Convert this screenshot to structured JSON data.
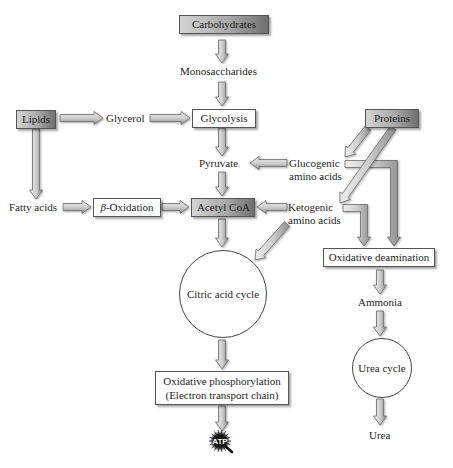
{
  "diagram": {
    "colors": {
      "box_gradient_light": "#d4d4d4",
      "box_gradient_dark": "#6f6f6f",
      "arrow_fill_light": "#e6e6e6",
      "arrow_fill_dark": "#9a9a9a",
      "arrow_stroke": "#6a6a6a",
      "atp_badge": "#111111"
    },
    "nodes": {
      "carbohydrates": "Carbohydrates",
      "monosaccharides": "Monosaccharides",
      "lipids": "Lipids",
      "glycerol": "Glycerol",
      "glycolysis": "Glycolysis",
      "proteins": "Proteins",
      "pyruvate": "Pyruvate",
      "glucogenic_line1": "Glucogenic",
      "glucogenic_line2": "amino acids",
      "fatty_acids": "Fatty acids",
      "beta_prefix": "β",
      "beta_oxidation": "-Oxidation",
      "acetyl_coa": "Acetyl CoA",
      "ketogenic_line1": "Ketogenic",
      "ketogenic_line2": "amino acids",
      "oxidative_deamination": "Oxidative deamination",
      "citric_acid_cycle": "Citric acid cycle",
      "ammonia": "Ammonia",
      "urea_cycle": "Urea cycle",
      "oxphos_line1": "Oxidative phosphorylation",
      "oxphos_line2": "(Electron transport chain)",
      "urea": "Urea",
      "atp": "ATP"
    },
    "edges": [
      {
        "from": "Carbohydrates",
        "to": "Monosaccharides"
      },
      {
        "from": "Monosaccharides",
        "to": "Glycolysis"
      },
      {
        "from": "Lipids",
        "to": "Glycerol"
      },
      {
        "from": "Glycerol",
        "to": "Glycolysis"
      },
      {
        "from": "Lipids",
        "to": "Fatty acids"
      },
      {
        "from": "Glycolysis",
        "to": "Pyruvate"
      },
      {
        "from": "Proteins",
        "to": "Glucogenic amino acids"
      },
      {
        "from": "Proteins",
        "to": "Ketogenic amino acids"
      },
      {
        "from": "Glucogenic amino acids",
        "to": "Pyruvate"
      },
      {
        "from": "Glucogenic amino acids",
        "to": "Oxidative deamination"
      },
      {
        "from": "Fatty acids",
        "to": "β-Oxidation"
      },
      {
        "from": "β-Oxidation",
        "to": "Acetyl CoA"
      },
      {
        "from": "Pyruvate",
        "to": "Acetyl CoA"
      },
      {
        "from": "Ketogenic amino acids",
        "to": "Acetyl CoA"
      },
      {
        "from": "Ketogenic amino acids",
        "to": "Citric acid cycle"
      },
      {
        "from": "Ketogenic amino acids",
        "to": "Oxidative deamination"
      },
      {
        "from": "Acetyl CoA",
        "to": "Citric acid cycle"
      },
      {
        "from": "Citric acid cycle",
        "to": "Oxidative phosphorylation"
      },
      {
        "from": "Oxidative phosphorylation",
        "to": "ATP"
      },
      {
        "from": "Oxidative deamination",
        "to": "Ammonia"
      },
      {
        "from": "Ammonia",
        "to": "Urea cycle"
      },
      {
        "from": "Urea cycle",
        "to": "Urea"
      }
    ]
  }
}
